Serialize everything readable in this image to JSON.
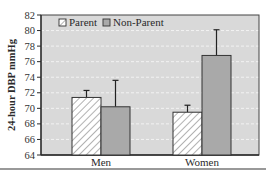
{
  "chart_data": {
    "type": "bar",
    "title": "",
    "xlabel": "",
    "ylabel": "24-hour DBP mmHg",
    "ylim": [
      64,
      82
    ],
    "yticks": [
      64,
      66,
      68,
      70,
      72,
      74,
      76,
      78,
      80,
      82
    ],
    "grid": true,
    "legend_position": "top-left inside",
    "categories": [
      "Men",
      "Women"
    ],
    "series": [
      {
        "name": "Parent",
        "values": [
          71.4,
          69.5
        ],
        "error_upper": [
          72.3,
          70.4
        ],
        "pattern": "hatched",
        "color": "#ffffff"
      },
      {
        "name": "Non-Parent",
        "values": [
          70.2,
          76.8
        ],
        "error_upper": [
          73.6,
          80.1
        ],
        "pattern": "solid",
        "color": "#a9a9a9"
      }
    ]
  },
  "colors": {
    "plot_background": "#d9d9d9",
    "grid": "#f2f2f2",
    "axis": "#2a2a2a",
    "non_parent_fill": "#a9a9a9",
    "parent_fill": "#ffffff"
  }
}
